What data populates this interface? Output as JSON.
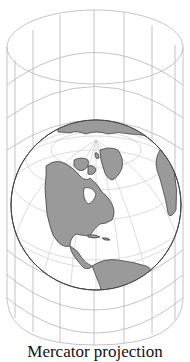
{
  "figure": {
    "caption": "Mercator projection",
    "colors": {
      "land": "#9a9a9a",
      "ocean": "#ffffff",
      "grid": "#b8b8b8",
      "outline": "#555555"
    },
    "continents_shown": [
      "North America",
      "Greenland",
      "Central America",
      "South America",
      "Arctic islands",
      "Northern Europe"
    ]
  }
}
